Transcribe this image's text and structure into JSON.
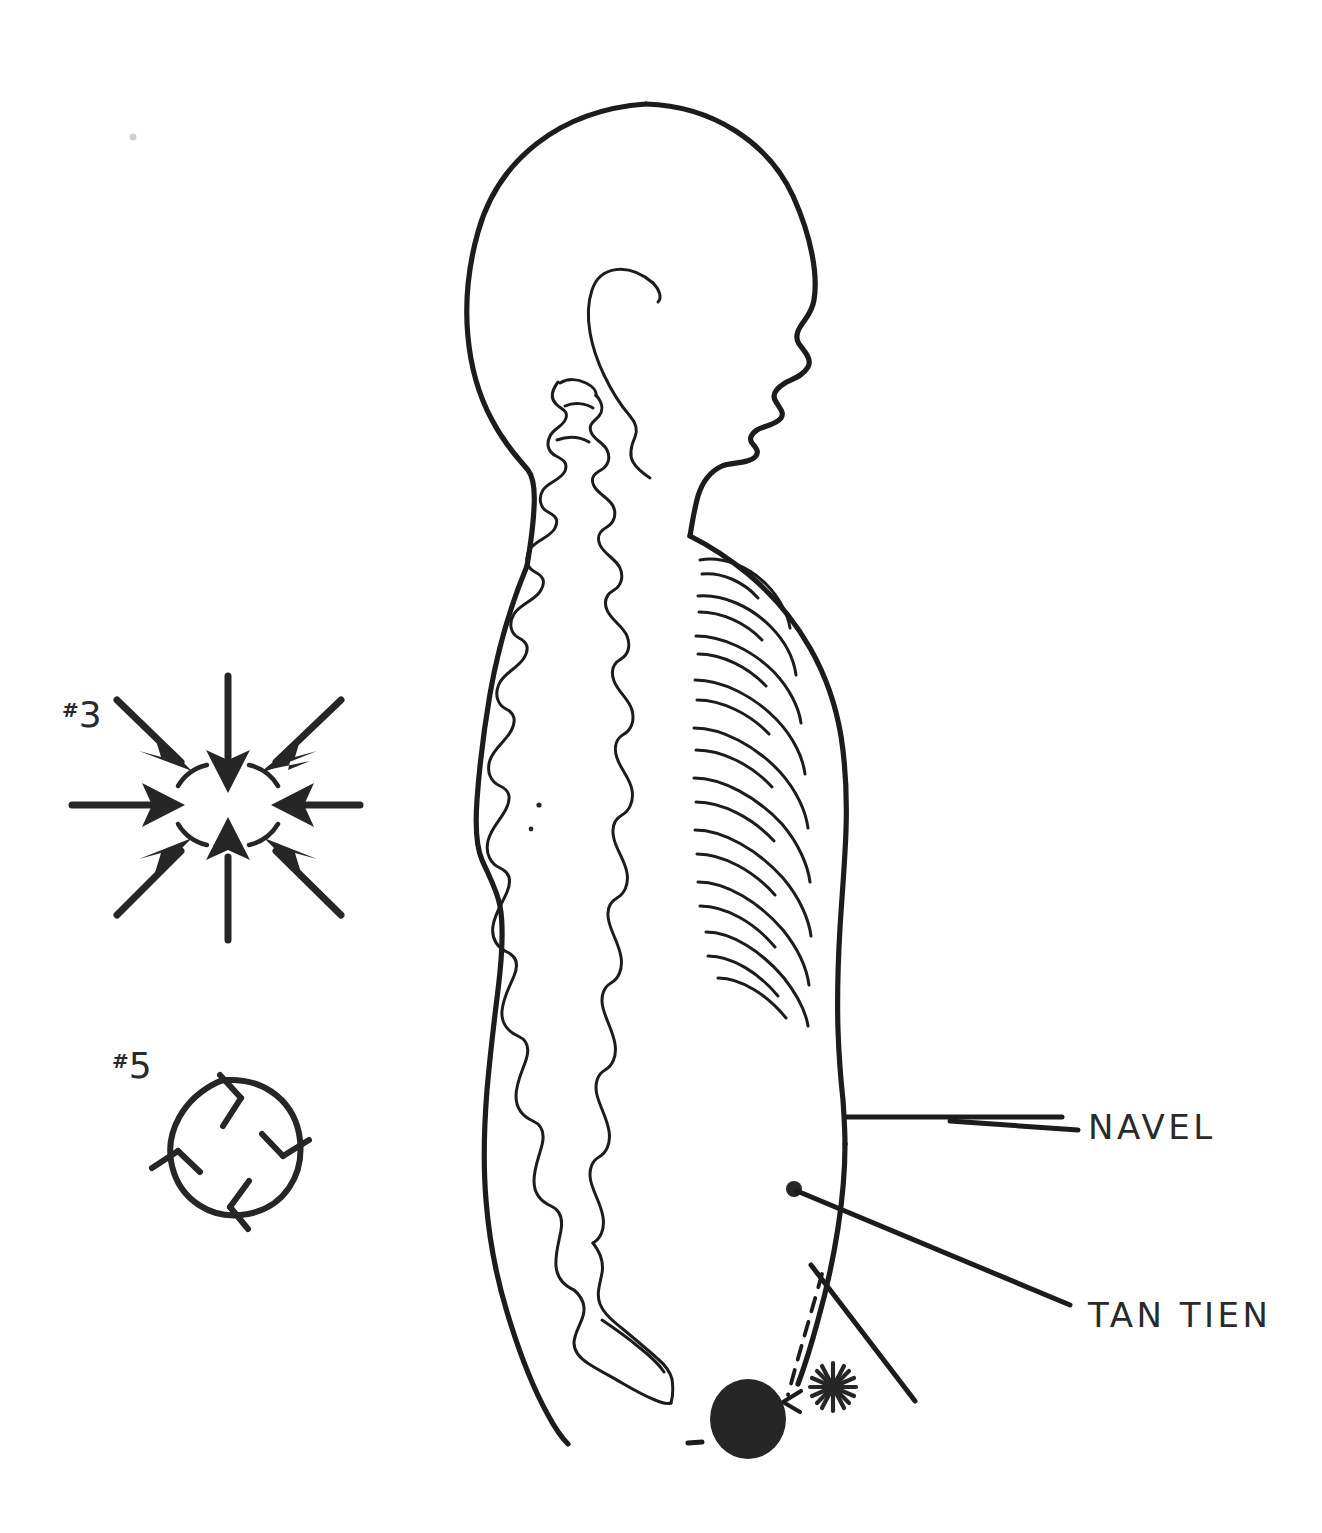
{
  "figure": {
    "ink_color": "#1c1c1c",
    "fill_color": "#262626",
    "background_color": "#ffffff"
  },
  "labels": {
    "navel": "NAVEL",
    "tan_tien": "TAN TIEN"
  },
  "symbols": [
    {
      "id": "symbol-3",
      "hash": "#",
      "number": "3",
      "caption": "#3",
      "description": "eight arrows converging inward toward a central ring"
    },
    {
      "id": "symbol-5",
      "hash": "#",
      "number": "5",
      "caption": "#5",
      "description": "circle with four outward-pointing barbed marks"
    }
  ],
  "annotations": {
    "tan_tien_marker": "filled oval energy center at lower abdomen",
    "asterisk": "asterisk burst marker",
    "dashed_arrow": "dashed arrow pointing left toward the tan tien oval",
    "navel_dot": "small filled dot marking the tan tien leader origin"
  },
  "body_parts": {
    "head": "head in right-facing profile",
    "ear": "ear",
    "cervical_spine": "cervical vertebrae",
    "thoracic_spine": "thoracic vertebrae",
    "lumbar_spine": "lumbar vertebrae",
    "sacrum": "sacrum and coccyx",
    "ribs": "rib cage",
    "back_contour": "posterior body contour",
    "front_contour": "anterior body contour"
  }
}
